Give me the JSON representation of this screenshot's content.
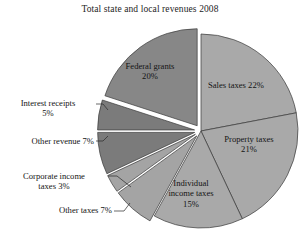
{
  "chart_data": {
    "type": "pie",
    "title": "Total state and local revenues 2008",
    "xlabel": "",
    "ylabel": "",
    "legend_position": "none",
    "grid": false,
    "units": "percent",
    "total": 100,
    "categories": [
      "Sales taxes",
      "Property taxes",
      "Individual income taxes",
      "Other taxes",
      "Corporate income taxes",
      "Other revenue",
      "Interest receipts",
      "Federal grants"
    ],
    "values": [
      22,
      21,
      15,
      7,
      3,
      7,
      5,
      20
    ],
    "slices": [
      {
        "name": "Sales taxes",
        "value": 22,
        "label": "Sales taxes 22%",
        "label_lines": [
          "Sales taxes 22%"
        ],
        "label_placement": "inside",
        "color": "#a9a9a9",
        "exploded": false
      },
      {
        "name": "Property taxes",
        "value": 21,
        "label": "Property taxes 21%",
        "label_lines": [
          "Property taxes",
          "21%"
        ],
        "label_placement": "inside",
        "color": "#a9a9a9",
        "exploded": false
      },
      {
        "name": "Individual income taxes",
        "value": 15,
        "label": "Individual income taxes 15%",
        "label_lines": [
          "Individual",
          "income taxes",
          "15%"
        ],
        "label_placement": "inside",
        "color": "#a9a9a9",
        "exploded": false
      },
      {
        "name": "Other taxes",
        "value": 7,
        "label": "Other taxes 7%",
        "label_lines": [
          "Other taxes 7%"
        ],
        "label_placement": "outside",
        "color": "#a4a4a4",
        "exploded": true
      },
      {
        "name": "Corporate income taxes",
        "value": 3,
        "label": "Corporate income taxes 3%",
        "label_lines": [
          "Corporate income",
          "taxes 3%"
        ],
        "label_placement": "outside",
        "color": "#a4a4a4",
        "exploded": true
      },
      {
        "name": "Other revenue",
        "value": 7,
        "label": "Other revenue 7%",
        "label_lines": [
          "Other revenue 7%"
        ],
        "label_placement": "outside",
        "color": "#7b7b7b",
        "exploded": true
      },
      {
        "name": "Interest receipts",
        "value": 5,
        "label": "Interest receipts 5%",
        "label_lines": [
          "Interest receipts",
          "5%"
        ],
        "label_placement": "outside",
        "color": "#7b7b7b",
        "exploded": true
      },
      {
        "name": "Federal grants",
        "value": 20,
        "label": "Federal grants 20%",
        "label_lines": [
          "Federal grants",
          "20%"
        ],
        "label_placement": "inside",
        "color": "#878787",
        "exploded": true
      }
    ],
    "colors": {
      "light_gray": "#a9a9a9",
      "mid_gray": "#878787",
      "dark_gray": "#7b7b7b",
      "outline": "#3a3a3a",
      "background": "#ffffff",
      "text": "#141414"
    }
  }
}
